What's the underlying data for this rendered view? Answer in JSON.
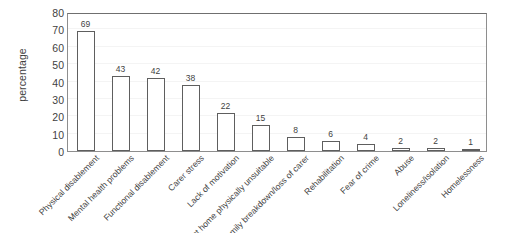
{
  "chart_data": {
    "type": "bar",
    "title": "",
    "subtitle": "",
    "xlabel": "",
    "ylabel": "percentage",
    "ylim": [
      0,
      80
    ],
    "y_ticks": [
      0,
      10,
      20,
      30,
      40,
      50,
      60,
      70,
      80
    ],
    "grid": true,
    "legend": "none",
    "orientation": "vertical",
    "bar_style": {
      "fill": "#ffffff",
      "edge": "#5e5e5e",
      "value_labels": true
    },
    "categories": [
      "Physical disablement",
      "Mental health problems",
      "Functional disablement",
      "Carer stress",
      "Lack of motivation",
      "Present home physically unsuitable",
      "Family breakdown/loss of carer",
      "Rehabilitation",
      "Fear of crime",
      "Abuse",
      "Loneliness/isolation",
      "Homelessness"
    ],
    "values": [
      69,
      43,
      42,
      38,
      22,
      15,
      8,
      6,
      4,
      2,
      2,
      1
    ],
    "series": [
      {
        "name": "percentage",
        "values": [
          69,
          43,
          42,
          38,
          22,
          15,
          8,
          6,
          4,
          2,
          2,
          1
        ]
      }
    ]
  },
  "colors": {
    "background": "#ffffff",
    "axis": "#8e8e8e",
    "text": "#3f3f3f",
    "bar_edge": "#5e5e5e",
    "bar_fill": "#ffffff",
    "gridline": "#f4f4f4"
  }
}
